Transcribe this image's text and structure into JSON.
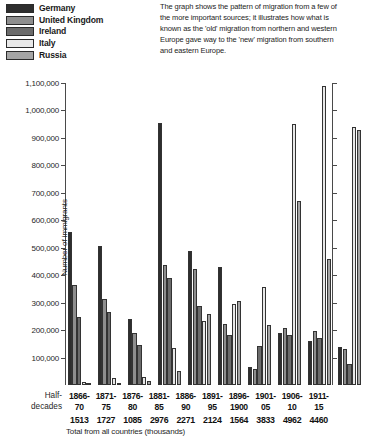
{
  "legend": {
    "items": [
      {
        "label": "Germany",
        "color": "#2e2e2e"
      },
      {
        "label": "United Kingdom",
        "color": "#8e8e8e"
      },
      {
        "label": "Ireland",
        "color": "#6b6b6b"
      },
      {
        "label": "Italy",
        "color": "#e8e8e8"
      },
      {
        "label": "Russia",
        "color": "#a5a5a5"
      }
    ]
  },
  "caption": "The graph shows the pattern of migration from a few of the more important sources; it illustrates how what is known as the 'old' migration from northern and western Europe gave way to the 'new' migration from southern and eastern Europe.",
  "axis": {
    "y_title": "Number of immigrants",
    "x_title": "Half-decades",
    "x_title_line1": "Half-",
    "x_title_line2": "decades",
    "total_note": "Total from all countries (thousands)",
    "y_ticks": [
      "1,100,000",
      "1,000,000",
      "900,000",
      "800,000",
      "700,000",
      "600,000",
      "500,000",
      "400,000",
      "300,000",
      "200,000",
      "100,000"
    ]
  },
  "chart_data": {
    "type": "bar",
    "title": "",
    "xlabel": "Half-decades",
    "ylabel": "Number of immigrants",
    "ylim": [
      0,
      1100000
    ],
    "ytick_step": 100000,
    "grid": false,
    "legend_position": "top-left",
    "categories": [
      "1866-70",
      "1871-75",
      "1876-80",
      "1881-85",
      "1886-90",
      "1891-95",
      "1896-1900",
      "1901-05",
      "1906-10",
      "1911-15"
    ],
    "category_lines": [
      [
        "1866-",
        "70"
      ],
      [
        "1871-",
        "75"
      ],
      [
        "1876-",
        "80"
      ],
      [
        "1881-",
        "85"
      ],
      [
        "1886-",
        "90"
      ],
      [
        "1891-",
        "95"
      ],
      [
        "1896-",
        "1900"
      ],
      [
        "1901-",
        "05"
      ],
      [
        "1906-",
        "10"
      ],
      [
        "1911-",
        "15"
      ]
    ],
    "totals_thousands": [
      1513,
      1727,
      1085,
      2976,
      2271,
      2124,
      1564,
      3833,
      4962,
      4460
    ],
    "series": [
      {
        "name": "Germany",
        "color": "#2e2e2e",
        "values": [
          556000,
          508000,
          241000,
          955000,
          487000,
          431000,
          64000,
          188000,
          161000,
          138000
        ]
      },
      {
        "name": "United Kingdom",
        "color": "#8e8e8e",
        "values": [
          364000,
          313000,
          188000,
          437000,
          424000,
          223000,
          58000,
          208000,
          196000,
          130000
        ]
      },
      {
        "name": "Ireland",
        "color": "#6b6b6b",
        "values": [
          247000,
          266000,
          146000,
          390000,
          289000,
          182000,
          143000,
          182000,
          170000,
          76000
        ]
      },
      {
        "name": "Italy",
        "color": "#e8e8e8",
        "values": [
          11000,
          27000,
          30000,
          135000,
          234000,
          296000,
          356000,
          950000,
          1090000,
          940000
        ]
      },
      {
        "name": "Russia",
        "color": "#a5a5a5",
        "values": [
          2000,
          8000,
          13000,
          50000,
          258000,
          307000,
          218000,
          670000,
          460000,
          928000
        ]
      }
    ]
  }
}
